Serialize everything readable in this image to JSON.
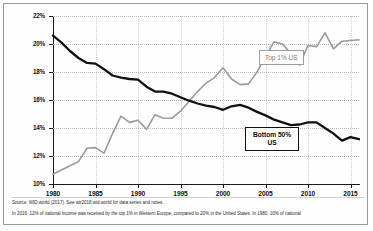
{
  "chart_data": {
    "type": "line",
    "title": "",
    "xlabel": "",
    "ylabel": "Share of national income (%)",
    "xlim": [
      1980,
      2016
    ],
    "ylim": [
      10,
      22
    ],
    "ytick_step": 2,
    "grid": true,
    "legend_position": "inline-annotations",
    "ytick_labels": [
      "10%",
      "12%",
      "14%",
      "16%",
      "18%",
      "20%",
      "22%"
    ],
    "ytick_values": [
      10,
      12,
      14,
      16,
      18,
      20,
      22
    ],
    "xtick_labels": [
      "1980",
      "1985",
      "1990",
      "1995",
      "2000",
      "2005",
      "2010",
      "2015"
    ],
    "xtick_values": [
      1980,
      1985,
      1990,
      1995,
      2000,
      2005,
      2010,
      2015
    ],
    "x": [
      1980,
      1981,
      1982,
      1983,
      1984,
      1985,
      1986,
      1987,
      1988,
      1989,
      1990,
      1991,
      1992,
      1993,
      1994,
      1995,
      1996,
      1997,
      1998,
      1999,
      2000,
      2001,
      2002,
      2003,
      2004,
      2005,
      2006,
      2007,
      2008,
      2009,
      2010,
      2011,
      2012,
      2013,
      2014,
      2015,
      2016
    ],
    "series": [
      {
        "name": "Bottom 50% US",
        "color": "#111111",
        "label_text": "Bottom 50%\nUS",
        "values": [
          20.6,
          20.1,
          19.5,
          19.0,
          18.65,
          18.6,
          18.2,
          17.75,
          17.6,
          17.5,
          17.45,
          16.95,
          16.6,
          16.6,
          16.45,
          16.2,
          15.95,
          15.75,
          15.6,
          15.5,
          15.3,
          15.55,
          15.65,
          15.45,
          15.15,
          14.9,
          14.6,
          14.4,
          14.2,
          14.25,
          14.4,
          14.4,
          14.0,
          13.6,
          13.1,
          13.35,
          13.2
        ]
      },
      {
        "name": "Top 1% US",
        "color": "#9b9b9b",
        "label_text": "Top 1% US",
        "values": [
          10.7,
          11.0,
          11.3,
          11.6,
          12.55,
          12.6,
          12.2,
          13.6,
          14.85,
          14.4,
          14.55,
          13.9,
          14.95,
          14.7,
          14.7,
          15.2,
          15.9,
          16.6,
          17.2,
          17.6,
          18.3,
          17.5,
          17.1,
          17.15,
          18.0,
          19.1,
          20.15,
          20.0,
          19.3,
          18.5,
          19.9,
          19.8,
          20.8,
          19.65,
          20.2,
          20.25,
          20.3
        ]
      }
    ]
  },
  "axis": {
    "y_title": "Share of national income (%)"
  },
  "annotations": {
    "top1_label": "Top 1% US",
    "bottom50_label_line1": "Bottom 50%",
    "bottom50_label_line2": "US"
  },
  "footnotes": {
    "source": "Source: WID.world (2017). See wir2018.wid.world for data series and notes.",
    "note": "In 2016, 12% of national income was received by the top 1% in Western Europe, compared to 20% in the United States. In 1980, 10% of national"
  },
  "colors": {
    "bottom50": "#111111",
    "top1": "#9b9b9b",
    "grid": "#b9b9b9",
    "axis": "#1a1a1a",
    "frame": "#9a9a9a"
  }
}
